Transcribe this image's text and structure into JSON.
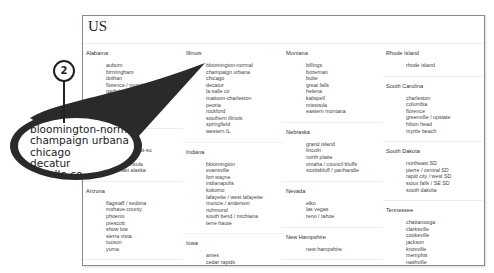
{
  "page": {
    "title": "US"
  },
  "columns": [
    [
      {
        "state": "Alabama",
        "cities": [
          "auburn",
          "birmingham",
          "dothan",
          "florence / muscle shoals",
          "gadsden-anniston",
          "huntsville / decatur",
          "mobile",
          "montgomery",
          "tuscaloosa"
        ]
      },
      {
        "state": "Alaska",
        "cities": [
          "anchorage / mat-su",
          "fairbanks",
          "kenai peninsula",
          "southeast alaska"
        ]
      },
      {
        "state": "Arizona",
        "cities": [
          "flagstaff / sedona",
          "mohave county",
          "phoenix",
          "prescott",
          "show low",
          "sierra vista",
          "tucson",
          "yuma"
        ]
      },
      {
        "state": "Arkansas",
        "cities": []
      }
    ],
    [
      {
        "state": "Illinois",
        "cities": [
          "bloomington-normal",
          "champaign urbana",
          "chicago",
          "decatur",
          "la salle co",
          "mattoon-charleston",
          "peoria",
          "rockford",
          "southern illinois",
          "springfield",
          "western IL"
        ]
      },
      {
        "state": "Indiana",
        "cities": [
          "bloomington",
          "evansville",
          "fort wayne",
          "indianapolis",
          "kokomo",
          "lafayette / west lafayette",
          "muncie / anderson",
          "richmond",
          "south bend / michiana",
          "terre haute"
        ]
      },
      {
        "state": "Iowa",
        "cities": [
          "ames",
          "cedar rapids",
          "des moines"
        ]
      }
    ],
    [
      {
        "state": "Montana",
        "cities": [
          "billings",
          "bozeman",
          "butte",
          "great falls",
          "helena",
          "kalispell",
          "missoula",
          "eastern montana"
        ]
      },
      {
        "state": "Nebraska",
        "cities": [
          "grand island",
          "lincoln",
          "north platte",
          "omaha / council bluffs",
          "scottsbluff / panhandle"
        ]
      },
      {
        "state": "Nevada",
        "cities": [
          "elko",
          "las vegas",
          "reno / tahoe"
        ]
      },
      {
        "state": "New Hampshire",
        "cities": [
          "new hampshire"
        ]
      },
      {
        "state": "New Jersey",
        "cities": []
      }
    ],
    [
      {
        "state": "Rhode Island",
        "cities": [
          "rhode island"
        ]
      },
      {
        "state": "South Carolina",
        "cities": [
          "charleston",
          "columbia",
          "florence",
          "greenville / upstate",
          "hilton head",
          "myrtle beach"
        ]
      },
      {
        "state": "South Dakota",
        "cities": [
          "northeast SD",
          "pierre / central SD",
          "rapid city / west SD",
          "sioux falls / SE SD",
          "south dakota"
        ]
      },
      {
        "state": "Tennessee",
        "cities": [
          "chattanooga",
          "clarksville",
          "cookeville",
          "jackson",
          "knoxville",
          "memphis",
          "nashville",
          "tri-cities"
        ]
      }
    ]
  ],
  "callout": {
    "step_number": "2",
    "magnified_lines": [
      "bloomington-normal",
      "champaign urbana",
      "chicago",
      "decatur",
      "la salle co"
    ]
  }
}
